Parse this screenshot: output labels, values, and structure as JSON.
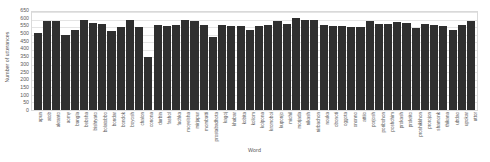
{
  "chart_data": {
    "type": "bar",
    "title": "",
    "xlabel": "Word",
    "ylabel": "Number of utterances",
    "ylim": [
      0,
      650
    ],
    "ytick_step": 50,
    "grid": true,
    "legend": false,
    "bar_color": "#2f2f2f",
    "axis_color": "#d9d9d9",
    "text_color": "#595959",
    "yticks": [
      650,
      600,
      550,
      500,
      450,
      400,
      350,
      300,
      250,
      200,
      150,
      100,
      50,
      0
    ],
    "categories": [
      "apun",
      "atob",
      "akranto",
      "aomy",
      "bangla",
      "bebsha",
      "bishtyato",
      "bolatobbo",
      "bondar",
      "bondok",
      "boyosh",
      "chalon",
      "conona",
      "durbin",
      "fashol",
      "fuchka",
      "moyelsha",
      "mirjapur",
      "mombatti",
      "prostabadhota",
      "kagoj",
      "khabar",
      "kobita",
      "koliom",
      "kolpona",
      "kromoboi",
      "kuponjo",
      "michil",
      "morjada",
      "nikash",
      "nirbachon",
      "nouka",
      "obonoti",
      "oggota",
      "ononno",
      "attiio",
      "porjosh",
      "poribohon",
      "poshchim",
      "prokash",
      "prokrito",
      "proshikkhon",
      "prorojon",
      "shamonk",
      "thikana",
      "ubdao",
      "upokar",
      "uttor"
    ],
    "values": [
      512,
      590,
      592,
      500,
      532,
      597,
      580,
      570,
      521,
      551,
      598,
      553,
      350,
      563,
      560,
      562,
      596,
      592,
      567,
      482,
      562,
      556,
      558,
      534,
      559,
      566,
      588,
      569,
      611,
      597,
      595,
      561,
      558,
      560,
      553,
      552,
      588,
      568,
      571,
      587,
      578,
      543,
      570,
      564,
      557,
      528,
      561,
      590
    ]
  }
}
